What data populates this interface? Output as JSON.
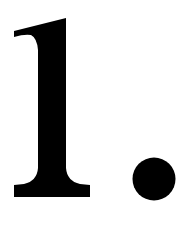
{
  "content": {
    "text": "1.",
    "numeral": "1",
    "punctuation": "."
  },
  "colors": {
    "background": "#ffffff",
    "ink": "#000000"
  }
}
